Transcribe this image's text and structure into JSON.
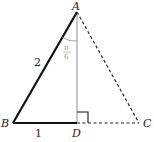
{
  "diagram": {
    "type": "triangle",
    "points": {
      "A": {
        "label": "A",
        "x": 77,
        "y": 12
      },
      "B": {
        "label": "B",
        "x": 13,
        "y": 123
      },
      "C": {
        "label": "C",
        "x": 139,
        "y": 123
      },
      "D": {
        "label": "D",
        "x": 77,
        "y": 123
      }
    },
    "segments": [
      {
        "from": "A",
        "to": "B",
        "style": "solid-bold",
        "label": "2"
      },
      {
        "from": "B",
        "to": "D",
        "style": "solid-bold",
        "label": "1"
      },
      {
        "from": "A",
        "to": "D",
        "style": "solid-gray"
      },
      {
        "from": "A",
        "to": "C",
        "style": "dashed"
      },
      {
        "from": "D",
        "to": "C",
        "style": "dashed"
      }
    ],
    "angle_label": {
      "numerator": "π",
      "denominator": "6",
      "at": "A",
      "between": [
        "AB",
        "AD"
      ]
    },
    "right_angle_at": "D",
    "side_labels": {
      "AB": "2",
      "BD": "1"
    },
    "colors": {
      "bold": "#111111",
      "gray": "#aaaaaa",
      "dashed": "#222222",
      "angle": "#999999"
    }
  }
}
